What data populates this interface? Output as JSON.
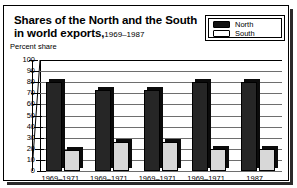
{
  "figure": {
    "title_line1": "Shares of the North and the South",
    "title_line2": "in world exports,",
    "title_years": "1969–1987",
    "axis_title": "Percent share"
  },
  "legend": {
    "position": "top-right",
    "entries": [
      {
        "label": "North",
        "swatch": "black-bar-icon",
        "color": "#262626"
      },
      {
        "label": "South",
        "swatch": "white-bar-icon",
        "color": "#d8d8d8"
      }
    ]
  },
  "chart_data": {
    "type": "bar",
    "xlabel": "",
    "ylabel": "Percent share",
    "ylim": [
      0,
      100
    ],
    "yticks": [
      0,
      10,
      20,
      30,
      40,
      50,
      60,
      70,
      80,
      90,
      100
    ],
    "grid": true,
    "legend_position": "top-right",
    "categories": [
      "1969–1971",
      "1969–1971",
      "1969–1971",
      "1969–1971",
      "1987"
    ],
    "series": [
      {
        "name": "North",
        "color": "#262626",
        "values": [
          80,
          73,
          73,
          80,
          80
        ]
      },
      {
        "name": "South",
        "color": "#d8d8d8",
        "values": [
          19,
          26,
          26,
          20,
          20
        ]
      }
    ]
  }
}
